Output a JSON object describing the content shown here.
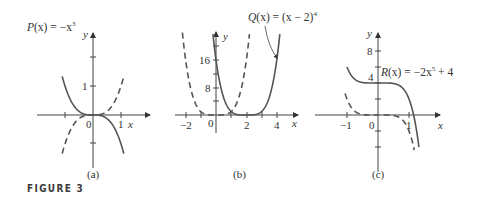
{
  "figure": {
    "label": "FIGURE 3"
  },
  "colors": {
    "curve": "#555555",
    "axis": "#444444",
    "text": "#333333"
  },
  "chart_data": [
    {
      "type": "line",
      "panel": "(a)",
      "annotation": "P(x) = −x³",
      "xlabel": "x",
      "ylabel": "y",
      "x_ticks": [
        -1,
        0,
        1
      ],
      "x_tick_labels": [
        "0",
        "1"
      ],
      "y_ticks": [
        -1,
        1,
        2
      ],
      "y_tick_labels": [
        "1"
      ],
      "series": [
        {
          "name": "P(x) = -x^3",
          "style": "solid",
          "formula": "-x^3",
          "x_range": [
            -1.1,
            1.1
          ]
        },
        {
          "name": "y = x^3",
          "style": "dashed",
          "formula": "x^3",
          "x_range": [
            -1.1,
            1.1
          ]
        }
      ]
    },
    {
      "type": "line",
      "panel": "(b)",
      "annotation": "Q(x) = (x − 2)⁴",
      "xlabel": "x",
      "ylabel": "y",
      "x_ticks": [
        -2,
        0,
        2,
        4
      ],
      "x_tick_labels": [
        "−2",
        "0",
        "2",
        "4"
      ],
      "y_ticks": [
        8,
        16
      ],
      "y_tick_labels": [
        "8",
        "16"
      ],
      "series": [
        {
          "name": "Q(x) = (x-2)^4",
          "style": "solid",
          "formula": "(x-2)^4",
          "x_range": [
            -0.2,
            4.2
          ]
        },
        {
          "name": "y = x^4",
          "style": "dashed",
          "formula": "x^4",
          "x_range": [
            -2.3,
            2.2
          ]
        }
      ]
    },
    {
      "type": "line",
      "panel": "(c)",
      "annotation": "R(x) = −2x⁵ + 4",
      "xlabel": "x",
      "ylabel": "y",
      "x_ticks": [
        -1,
        0,
        1
      ],
      "x_tick_labels": [
        "−1",
        "0",
        "1"
      ],
      "y_ticks": [
        -4,
        -2,
        2,
        4,
        6,
        8
      ],
      "y_tick_labels": [
        "4",
        "8"
      ],
      "series": [
        {
          "name": "R(x) = -2x^5 + 4",
          "style": "solid",
          "formula": "-2x^5+4",
          "x_range": [
            -1.0,
            1.32
          ]
        },
        {
          "name": "y = -2x^5",
          "style": "dashed",
          "formula": "-2x^5",
          "x_range": [
            -1.06,
            1.17
          ]
        }
      ]
    }
  ],
  "panels": {
    "a": {
      "caption": "(a)",
      "eq_left": "P",
      "eq_arg": "(x)",
      "eq_rhs": " = −x",
      "eq_exp": "3",
      "x0": "0",
      "x1": "1",
      "y1": "1",
      "xlabel": "x",
      "ylabel": "y"
    },
    "b": {
      "caption": "(b)",
      "eq_left": "Q",
      "eq_arg": "(x)",
      "eq_rhs": " = (x − 2)",
      "eq_exp": "4",
      "xm2": "−2",
      "x0": "0",
      "x2": "2",
      "x4": "4",
      "y8": "8",
      "y16": "16",
      "xlabel": "x",
      "ylabel": "y"
    },
    "c": {
      "caption": "(c)",
      "eq_left": "R",
      "eq_arg": "(x)",
      "eq_rhs": " = −2x",
      "eq_exp": "5",
      "eq_tail": " + 4",
      "xm1": "−1",
      "x0": "0",
      "x1": "1",
      "y4": "4",
      "y8": "8",
      "xlabel": "x",
      "ylabel": "y"
    }
  }
}
